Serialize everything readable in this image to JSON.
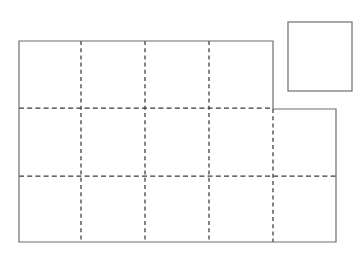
{
  "figure": {
    "background_color": "#ffffff",
    "solid_edge_color": "#6e6e6e",
    "dashed_grid_color": "#3a3a3a",
    "fill_color": "#ffffff",
    "canvas": {
      "width": 358,
      "height": 268
    },
    "shapes": [
      {
        "name": "main-step-polygon",
        "kind": "polygon",
        "stroke_style": "solid",
        "points": "19,41 273,41 273,109 336,109 336,242 19,242",
        "vertices": [
          {
            "x": 19,
            "y": 41
          },
          {
            "x": 273,
            "y": 41
          },
          {
            "x": 273,
            "y": 109
          },
          {
            "x": 336,
            "y": 109
          },
          {
            "x": 336,
            "y": 242
          },
          {
            "x": 19,
            "y": 242
          }
        ],
        "bounds": {
          "left": 19,
          "top": 41,
          "right": 336,
          "bottom": 242,
          "width": 317,
          "height": 201
        }
      },
      {
        "name": "unit-square",
        "kind": "rect",
        "stroke_style": "solid",
        "x": 288,
        "y": 22,
        "width": 64,
        "height": 69
      }
    ],
    "grid_lines": {
      "vertical": [
        {
          "name": "grid-line-v-1",
          "x": 81,
          "y1": 41,
          "y2": 242
        },
        {
          "name": "grid-line-v-2",
          "x": 145,
          "y1": 41,
          "y2": 242
        },
        {
          "name": "grid-line-v-3",
          "x": 209,
          "y1": 41,
          "y2": 242
        },
        {
          "name": "grid-line-v-4",
          "x": 273,
          "y1": 109,
          "y2": 242
        }
      ],
      "horizontal": [
        {
          "name": "grid-line-h-1",
          "y": 108,
          "x1": 19,
          "x2": 273
        },
        {
          "name": "grid-line-h-2",
          "y": 176,
          "x1": 19,
          "x2": 336
        }
      ]
    },
    "counts": {
      "columns": 5,
      "rows": 3,
      "labels": []
    },
    "labels": []
  }
}
